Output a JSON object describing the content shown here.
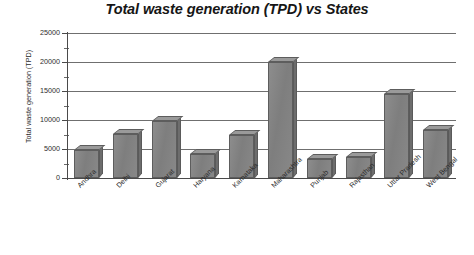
{
  "chart_data": {
    "type": "bar",
    "title": "Total waste generation (TPD) vs States",
    "xlabel": "",
    "ylabel": "Total waste generation (TPD)",
    "ylim": [
      0,
      25000
    ],
    "ytick_labels": [
      "25000",
      "20000",
      "15000",
      "10000",
      "5000",
      "0"
    ],
    "ytick_values": [
      25000,
      20000,
      15000,
      10000,
      5000,
      0
    ],
    "minor_tick_interval": 2500,
    "grid": true,
    "legend": false,
    "style": "3d-column",
    "bar_color": "#808080",
    "categories": [
      "Andhra",
      "Delhi",
      "Gujarat",
      "Haryana",
      "Karnataka",
      "Maharashtra",
      "Punjab",
      "Rajasthan",
      "Uttar Pradesh",
      "West Bengal"
    ],
    "values": [
      4800,
      7600,
      9900,
      4200,
      7500,
      20000,
      3200,
      3700,
      14500,
      8200
    ]
  }
}
